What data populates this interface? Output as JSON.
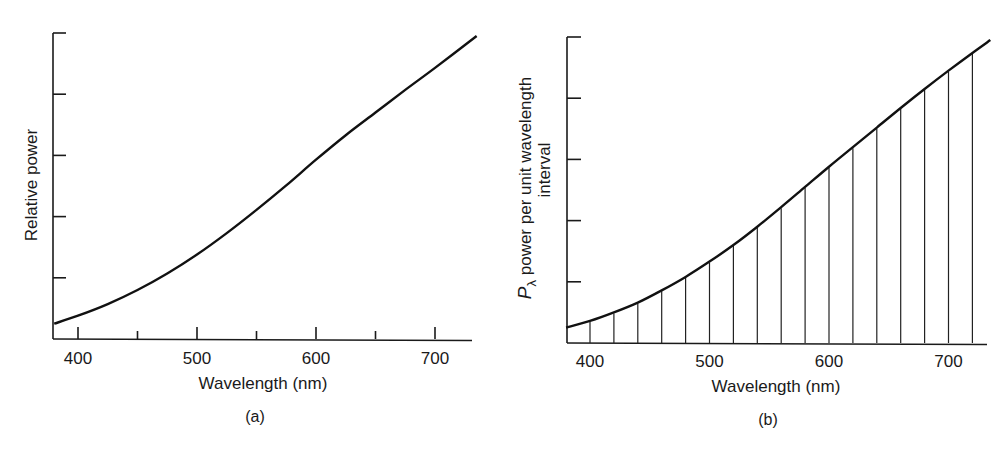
{
  "chart_data": [
    {
      "id": "a",
      "type": "line",
      "panel_label": "(a)",
      "title": "",
      "xlabel": "Wavelength (nm)",
      "ylabel": "Relative power",
      "x_ticks": [
        400,
        500,
        600,
        700
      ],
      "x_minor_ticks": [
        450,
        550,
        650
      ],
      "xlim": [
        380,
        735
      ],
      "ylim": [
        0,
        5
      ],
      "y_ticks_unlabeled": [
        1,
        2,
        3,
        4,
        5
      ],
      "grid": false,
      "series": [
        {
          "name": "Relative power",
          "x": [
            380,
            400,
            425,
            450,
            475,
            500,
            525,
            550,
            575,
            600,
            625,
            650,
            675,
            700,
            735
          ],
          "y": [
            0.25,
            0.38,
            0.57,
            0.8,
            1.07,
            1.38,
            1.73,
            2.11,
            2.51,
            2.93,
            3.33,
            3.7,
            4.07,
            4.43,
            4.95
          ]
        }
      ]
    },
    {
      "id": "b",
      "type": "line",
      "panel_label": "(b)",
      "title": "",
      "xlabel": "Wavelength (nm)",
      "ylabel": "P_λ power per unit wavelength interval",
      "ylabel_symbol": "P",
      "ylabel_subscript": "λ",
      "ylabel_line1": " power per unit wavelength",
      "ylabel_line2": "interval",
      "x_ticks": [
        400,
        500,
        600,
        700
      ],
      "xlim": [
        380,
        735
      ],
      "ylim": [
        0,
        5
      ],
      "y_ticks_unlabeled": [
        1,
        2,
        3,
        4,
        5
      ],
      "grid": false,
      "sampling_interval_nm": 20,
      "sample_lines_x": [
        400,
        420,
        440,
        460,
        480,
        500,
        520,
        540,
        560,
        580,
        600,
        620,
        640,
        660,
        680,
        700,
        720
      ],
      "series": [
        {
          "name": "P_lambda",
          "x": [
            380,
            400,
            420,
            440,
            460,
            480,
            500,
            520,
            540,
            560,
            580,
            600,
            620,
            640,
            660,
            680,
            700,
            720,
            735
          ],
          "y": [
            0.25,
            0.36,
            0.5,
            0.66,
            0.86,
            1.08,
            1.33,
            1.6,
            1.9,
            2.22,
            2.55,
            2.88,
            3.2,
            3.52,
            3.84,
            4.15,
            4.45,
            4.74,
            4.95
          ]
        }
      ]
    }
  ]
}
